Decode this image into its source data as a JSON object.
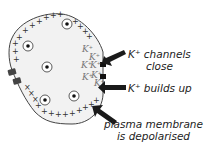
{
  "diagram": {
    "type": "cell membrane depolarisation",
    "cell": {
      "fill": "#f2f2f2",
      "outline": "#333333",
      "outside_charge_symbol": "+",
      "inside_charge_symbol": "+",
      "nuclei_count": 6
    },
    "ions": [
      "K+",
      "K+",
      "K+",
      "K+",
      "K+",
      "K+",
      "K+",
      "K+"
    ],
    "labels": {
      "channels_line1": "K⁺ channels",
      "channels_line2": "close",
      "buildup": "K⁺ builds up",
      "membrane_line1": "plasma membrane",
      "membrane_line2": "is depolarised"
    },
    "colors": {
      "arrow": "#1a1a1a",
      "channel": "#222222",
      "text": "#222222",
      "ion_text": "#777777"
    }
  }
}
